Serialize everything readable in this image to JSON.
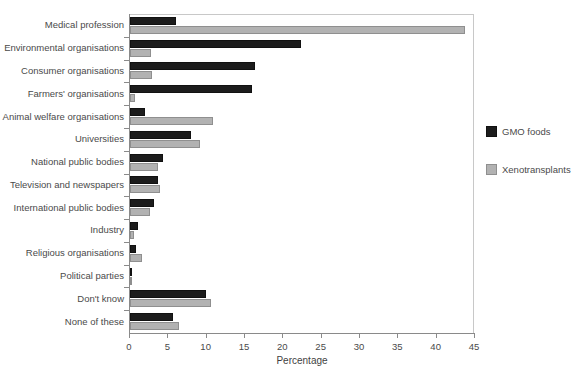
{
  "chart_data": {
    "type": "bar",
    "orientation": "horizontal",
    "title": "",
    "xlabel": "Percentage",
    "ylabel": "",
    "xlim": [
      0,
      45
    ],
    "xticks": [
      0,
      5,
      10,
      15,
      20,
      25,
      30,
      35,
      40,
      45
    ],
    "grid": false,
    "legend_position": "right",
    "categories": [
      "Medical profession",
      "Environmental organisations",
      "Consumer organisations",
      "Farmers' organisations",
      "Animal welfare organisations",
      "Universities",
      "National public bodies",
      "Television and newspapers",
      "International public bodies",
      "Industry",
      "Religious organisations",
      "Political parties",
      "Don't know",
      "None of these"
    ],
    "series": [
      {
        "name": "GMO foods",
        "color": "#1c1c1c",
        "values": [
          6.0,
          22.3,
          16.3,
          15.9,
          2.0,
          7.9,
          4.3,
          3.6,
          3.1,
          1.0,
          0.8,
          0.3,
          9.9,
          5.6
        ]
      },
      {
        "name": "Xenotransplants",
        "color": "#b2b2b2",
        "values": [
          43.7,
          2.8,
          2.9,
          0.6,
          10.8,
          9.1,
          3.6,
          3.9,
          2.6,
          0.5,
          1.5,
          0.3,
          10.5,
          6.4
        ]
      }
    ]
  }
}
